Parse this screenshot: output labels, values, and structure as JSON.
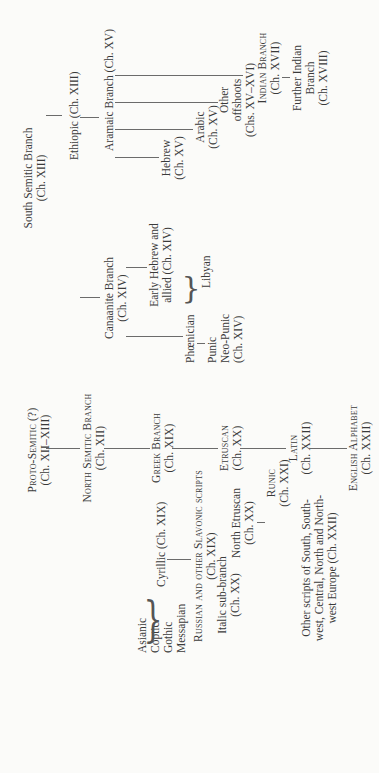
{
  "diagram": {
    "orientation": "rotated 90 degrees counter-clockwise",
    "trunk": {
      "proto_semitic": {
        "line1": "Proto-Semitic (?)",
        "line2": "(Ch. XII–XIII)"
      },
      "north_semitic": {
        "line1": "North Semitic Branch",
        "line2": "(Ch. XII)"
      },
      "greek": {
        "line1": "Greek Branch",
        "line2": "(Ch. XIX)"
      },
      "etruscan": {
        "line1": "Etruscan",
        "line2": "(Ch. XX)"
      },
      "latin": {
        "line1": "Latin",
        "line2": "(Ch. XXII)"
      },
      "english": {
        "line1": "English Alphabet",
        "line2": "(Ch. XXII)"
      }
    },
    "semitic": {
      "south_semitic": {
        "line1": "South Semitic Branch",
        "line2": "(Ch. XIII)"
      },
      "ethiopic": "Ethiopic (Ch. XIII)",
      "aramaic": "Aramaic Branch (Ch. XV)",
      "hebrew": {
        "line1": "Hebrew",
        "line2": "(Ch. XV)"
      },
      "arabic": {
        "line1": "Arabic",
        "line2": "(Ch. XV)"
      },
      "other_offshoots": {
        "line1": "Other",
        "line2": "offshoots",
        "line3": "(Chs. XV–XVI)"
      },
      "indian": {
        "line1": "Indian Branch",
        "line2": "(Ch. XVII)"
      },
      "further_indian": {
        "line1": "Further Indian",
        "line2": "Branch",
        "line3": "(Ch. XVIII)"
      },
      "canaanite": {
        "line1": "Canaanite Branch",
        "line2": "(Ch. XIV)"
      },
      "early_hebrew": {
        "line1": "Early Hebrew and",
        "line2": "allied (Ch. XIV)"
      },
      "phoenician": "Phœnician",
      "libyan": "Libyan",
      "punic": "Punic",
      "neo_punic": "Neo-Punic",
      "punic_ch": "(Ch. XIV)"
    },
    "greek_family": {
      "asianic": "Asianic",
      "coptic": "Coptic",
      "gothic": "Gothic",
      "messapian": "Messapian",
      "cyrillic": "Cyrillic (Ch. XIX)",
      "russian": {
        "line1": "Russian and other Slavonic scripts",
        "line2": "(Ch. XIX)"
      },
      "italic": {
        "line1": "Italic sub-branch",
        "line2": "(Ch. XX)"
      },
      "north_etruscan": {
        "line1": "North Etruscan",
        "line2": "(Ch. XX)"
      },
      "runic": {
        "line1": "Runic",
        "line2": "(Ch. XXI)"
      },
      "other_scripts": {
        "line1": "Other scripts of South, South-",
        "line2": "west, Central, North and North-",
        "line3": "west Europe (Ch. XXII)"
      }
    },
    "braces": {
      "left": "{",
      "right": "}"
    }
  }
}
